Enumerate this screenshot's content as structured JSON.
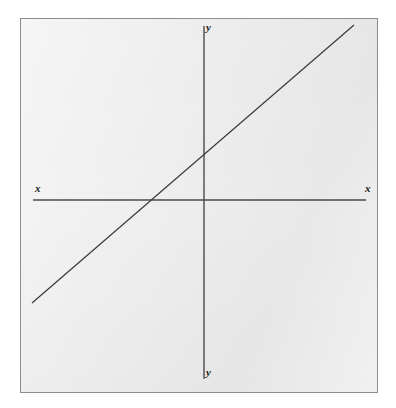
{
  "figure": {
    "frame": {
      "border_color": "#8d8d8d",
      "background_color": "#ededed",
      "page_background_color": "#ffffff"
    },
    "ink_color": "#3a3a3a"
  },
  "labels": {
    "y_top": "y",
    "y_bottom": "y",
    "x_left": "x",
    "x_right": "x"
  },
  "chart_data": {
    "type": "line",
    "title": "",
    "subtitle": "",
    "xlabel": "x",
    "ylabel": "y",
    "grid": false,
    "legend": null,
    "axes": {
      "x_axis": {
        "label_left": "x",
        "label_right": "x",
        "orientation": "horizontal",
        "x_start": 12,
        "x_end": 345,
        "y": 181,
        "ticks": [],
        "tick_labels": []
      },
      "y_axis": {
        "label_top": "y",
        "label_bottom": "y",
        "orientation": "vertical",
        "x": 183,
        "y_start": 7,
        "y_end": 360,
        "ticks": [],
        "tick_labels": []
      },
      "origin": {
        "x": 183,
        "y": 181
      }
    },
    "series": [
      {
        "name": "line",
        "kind": "straight-line",
        "slope_sign": "positive",
        "points": [
          {
            "x": 11,
            "y": 284
          },
          {
            "x": 333,
            "y": 6
          }
        ],
        "x_intercept": {
          "x": 128,
          "y": 181
        },
        "y_intercept": {
          "x": 183,
          "y": 137
        },
        "color": "#3a3a3a",
        "width": 1.2
      }
    ],
    "xlim": [
      0,
      358
    ],
    "ylim": [
      0,
      375
    ],
    "annotations": []
  }
}
